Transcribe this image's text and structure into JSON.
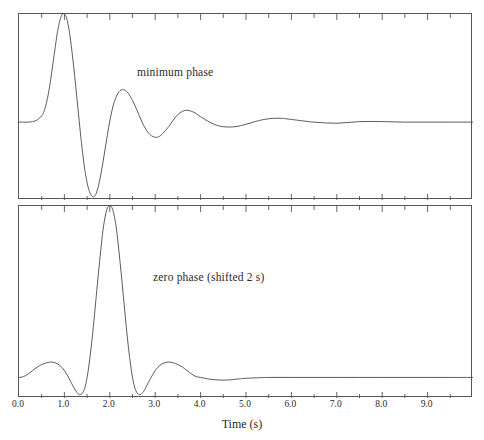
{
  "figure": {
    "axis_title": "Time (s)",
    "xlim": [
      0.0,
      10.0
    ],
    "xtick_labels": [
      "0.0",
      "1.0",
      "2.0",
      "3.0",
      "4.0",
      "5.0",
      "6.0",
      "7.0",
      "8.0",
      "9.0"
    ],
    "xtick_values": [
      0.0,
      1.0,
      2.0,
      3.0,
      4.0,
      5.0,
      6.0,
      7.0,
      8.0,
      9.0
    ],
    "minor_tick_step": 0.5,
    "line_color": "#4a4a4a",
    "frame_color": "#555555"
  },
  "panels": {
    "top": {
      "label": "minimum phase"
    },
    "bottom": {
      "label": "zero phase (shifted 2 s)"
    }
  },
  "chart_data": {
    "type": "line",
    "title": "",
    "xlabel": "Time (s)",
    "ylabel": "",
    "xlim": [
      0.0,
      10.0
    ],
    "grid": false,
    "legend": "none",
    "xticks": [
      0.0,
      1.0,
      2.0,
      3.0,
      4.0,
      5.0,
      6.0,
      7.0,
      8.0,
      9.0
    ],
    "xtick_labels": [
      "0.0",
      "1.0",
      "2.0",
      "3.0",
      "4.0",
      "5.0",
      "6.0",
      "7.0",
      "8.0",
      "9.0"
    ],
    "minor_xticks": [
      0.5,
      1.5,
      2.5,
      3.5,
      4.5,
      5.5,
      6.5,
      7.5,
      8.5,
      9.5
    ],
    "subplots": [
      {
        "name": "minimum phase",
        "annotation": "minimum phase",
        "annotation_xy": [
          2.6,
          0.62
        ],
        "ylim": [
          -0.72,
          1.0
        ],
        "baseline": 0.0,
        "series": [
          {
            "name": "minimum phase wavelet",
            "color": "#4a4a4a",
            "x": [
              0.0,
              0.1,
              0.2,
              0.3,
              0.4,
              0.5,
              0.55,
              0.6,
              0.65,
              0.7,
              0.75,
              0.8,
              0.85,
              0.9,
              0.95,
              1.0,
              1.05,
              1.1,
              1.15,
              1.2,
              1.25,
              1.3,
              1.35,
              1.4,
              1.45,
              1.5,
              1.55,
              1.6,
              1.65,
              1.7,
              1.75,
              1.8,
              1.85,
              1.9,
              1.95,
              2.0,
              2.05,
              2.1,
              2.2,
              2.3,
              2.4,
              2.5,
              2.6,
              2.7,
              2.8,
              2.9,
              3.0,
              3.1,
              3.2,
              3.3,
              3.4,
              3.5,
              3.6,
              3.7,
              3.8,
              3.9,
              4.0,
              4.2,
              4.4,
              4.6,
              4.8,
              5.0,
              5.2,
              5.4,
              5.6,
              5.8,
              6.0,
              6.5,
              7.0,
              7.5,
              8.0,
              8.5,
              9.0,
              9.5,
              10.0
            ],
            "y": [
              0.0,
              0.0,
              0.0,
              0.005,
              0.02,
              0.06,
              0.1,
              0.17,
              0.27,
              0.4,
              0.55,
              0.7,
              0.84,
              0.94,
              0.995,
              1.0,
              0.96,
              0.86,
              0.71,
              0.53,
              0.33,
              0.12,
              -0.09,
              -0.28,
              -0.44,
              -0.56,
              -0.64,
              -0.68,
              -0.69,
              -0.66,
              -0.59,
              -0.49,
              -0.37,
              -0.24,
              -0.11,
              0.01,
              0.11,
              0.19,
              0.28,
              0.3,
              0.27,
              0.2,
              0.11,
              0.01,
              -0.07,
              -0.12,
              -0.14,
              -0.13,
              -0.09,
              -0.04,
              0.02,
              0.07,
              0.1,
              0.11,
              0.1,
              0.08,
              0.05,
              0.0,
              -0.035,
              -0.045,
              -0.04,
              -0.02,
              0.005,
              0.025,
              0.035,
              0.035,
              0.025,
              0.0,
              -0.01,
              0.005,
              0.005,
              0.0,
              0.0,
              0.0,
              0.0
            ]
          }
        ]
      },
      {
        "name": "zero phase (shifted 2 s)",
        "annotation": "zero phase (shifted 2 s)",
        "annotation_xy": [
          3.0,
          0.6
        ],
        "ylim": [
          -0.12,
          1.0
        ],
        "baseline": 0.0,
        "center_time": 2.0,
        "series": [
          {
            "name": "zero phase wavelet",
            "color": "#4a4a4a",
            "x": [
              0.0,
              0.1,
              0.2,
              0.3,
              0.4,
              0.5,
              0.6,
              0.7,
              0.8,
              0.9,
              1.0,
              1.1,
              1.2,
              1.3,
              1.35,
              1.4,
              1.45,
              1.5,
              1.55,
              1.6,
              1.65,
              1.7,
              1.75,
              1.8,
              1.85,
              1.9,
              1.95,
              2.0,
              2.05,
              2.1,
              2.15,
              2.2,
              2.25,
              2.3,
              2.35,
              2.4,
              2.45,
              2.5,
              2.55,
              2.6,
              2.65,
              2.7,
              2.75,
              2.8,
              2.9,
              3.0,
              3.1,
              3.2,
              3.3,
              3.4,
              3.5,
              3.6,
              3.7,
              3.8,
              3.9,
              4.0,
              4.2,
              4.4,
              4.6,
              4.8,
              5.0,
              5.5,
              6.0,
              6.5,
              7.0,
              7.5,
              8.0,
              8.5,
              9.0,
              9.5,
              10.0
            ],
            "y": [
              0.0,
              0.005,
              0.02,
              0.04,
              0.06,
              0.075,
              0.085,
              0.09,
              0.085,
              0.07,
              0.04,
              -0.005,
              -0.055,
              -0.095,
              -0.1,
              -0.09,
              -0.06,
              0.0,
              0.09,
              0.2,
              0.33,
              0.47,
              0.61,
              0.74,
              0.86,
              0.94,
              0.99,
              1.0,
              0.99,
              0.94,
              0.86,
              0.74,
              0.61,
              0.47,
              0.33,
              0.2,
              0.09,
              0.0,
              -0.06,
              -0.09,
              -0.1,
              -0.095,
              -0.08,
              -0.055,
              -0.005,
              0.04,
              0.07,
              0.085,
              0.09,
              0.085,
              0.075,
              0.06,
              0.04,
              0.02,
              0.005,
              0.0,
              -0.01,
              -0.015,
              -0.015,
              -0.01,
              -0.005,
              0.0,
              0.0,
              0.0,
              0.0,
              0.0,
              0.0,
              0.0,
              0.0,
              0.0,
              0.0
            ]
          }
        ]
      }
    ]
  }
}
